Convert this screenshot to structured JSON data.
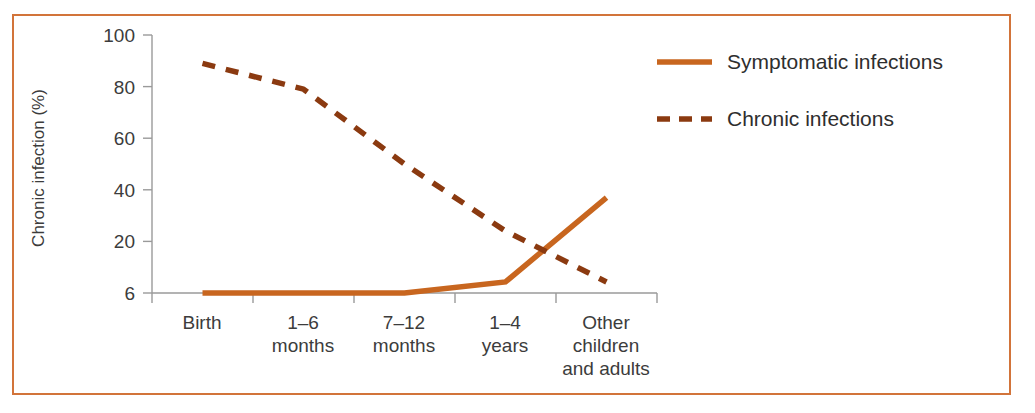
{
  "figure": {
    "frame_color": "#D2743A",
    "background": "#ffffff"
  },
  "axis": {
    "y_title": "Chronic infection (%)",
    "y_ticks": [
      "100",
      "80",
      "60",
      "40",
      "20",
      "6"
    ],
    "x_ticks": [
      {
        "line1": "Birth",
        "line2": "",
        "line3": ""
      },
      {
        "line1": "1–6",
        "line2": "months",
        "line3": ""
      },
      {
        "line1": "7–12",
        "line2": "months",
        "line3": ""
      },
      {
        "line1": "1–4",
        "line2": "years",
        "line3": ""
      },
      {
        "line1": "Other",
        "line2": "children",
        "line3": "and adults"
      }
    ]
  },
  "legend": {
    "items": [
      {
        "label": "Symptomatic infections",
        "style": "solid",
        "color": "#C8661F"
      },
      {
        "label": "Chronic infections",
        "style": "dashed",
        "color": "#8B3A10"
      }
    ]
  },
  "chart_data": {
    "type": "line",
    "title": "",
    "xlabel": "",
    "ylabel": "Chronic infection (%)",
    "categories": [
      "Birth",
      "1–6 months",
      "7–12 months",
      "1–4 years",
      "Other children and adults"
    ],
    "ylim": [
      6,
      100
    ],
    "ytick_values": [
      100,
      80,
      60,
      40,
      20,
      6
    ],
    "grid": false,
    "legend_position": "top-right",
    "series": [
      {
        "name": "Symptomatic infections",
        "style": "solid",
        "color": "#C8661F",
        "values": [
          6,
          6,
          6,
          9,
          37
        ]
      },
      {
        "name": "Chronic infections",
        "style": "dashed",
        "color": "#8B3A10",
        "values": [
          89,
          79,
          50,
          24,
          9
        ]
      }
    ]
  }
}
